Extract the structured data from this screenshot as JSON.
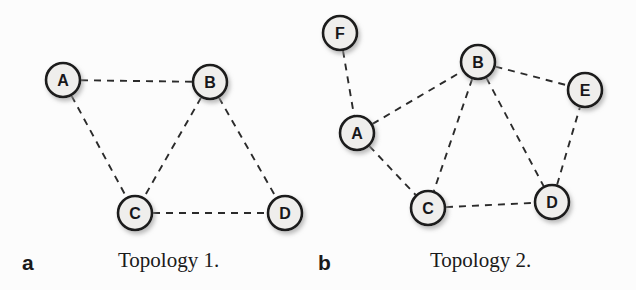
{
  "figure": {
    "width": 636,
    "height": 290,
    "background_color": "#fcfcfc",
    "node_fill_color": "#efeeec",
    "node_stroke_color": "#1b1b1b",
    "edge_color": "#2b2b2b",
    "edge_style": "dashed",
    "node_radius": 17,
    "node_stroke_width": 2.6,
    "edge_width": 1.9,
    "shadow_color": "#bdbdbd"
  },
  "panels": [
    {
      "letter": "a",
      "letter_x": 22,
      "letter_y": 252,
      "caption": "Topology 1.",
      "caption_x": 118,
      "caption_y": 250,
      "nodes": [
        {
          "id": "A",
          "label": "A",
          "x": 63,
          "y": 80
        },
        {
          "id": "B",
          "label": "B",
          "x": 210,
          "y": 82
        },
        {
          "id": "C",
          "label": "C",
          "x": 135,
          "y": 213
        },
        {
          "id": "D",
          "label": "D",
          "x": 285,
          "y": 213
        }
      ],
      "edges": [
        {
          "from": "A",
          "to": "B"
        },
        {
          "from": "A",
          "to": "C"
        },
        {
          "from": "B",
          "to": "C"
        },
        {
          "from": "B",
          "to": "D"
        },
        {
          "from": "C",
          "to": "D"
        }
      ]
    },
    {
      "letter": "b",
      "letter_x": 318,
      "letter_y": 252,
      "caption": "Topology 2.",
      "caption_x": 430,
      "caption_y": 250,
      "nodes": [
        {
          "id": "F",
          "label": "F",
          "x": 340,
          "y": 33
        },
        {
          "id": "A",
          "label": "A",
          "x": 357,
          "y": 133
        },
        {
          "id": "B",
          "label": "B",
          "x": 478,
          "y": 62
        },
        {
          "id": "E",
          "label": "E",
          "x": 585,
          "y": 90
        },
        {
          "id": "C",
          "label": "C",
          "x": 428,
          "y": 208
        },
        {
          "id": "D",
          "label": "D",
          "x": 552,
          "y": 202
        }
      ],
      "edges": [
        {
          "from": "F",
          "to": "A"
        },
        {
          "from": "A",
          "to": "B"
        },
        {
          "from": "A",
          "to": "C"
        },
        {
          "from": "B",
          "to": "C"
        },
        {
          "from": "B",
          "to": "D"
        },
        {
          "from": "B",
          "to": "E"
        },
        {
          "from": "C",
          "to": "D"
        },
        {
          "from": "D",
          "to": "E"
        }
      ]
    }
  ]
}
